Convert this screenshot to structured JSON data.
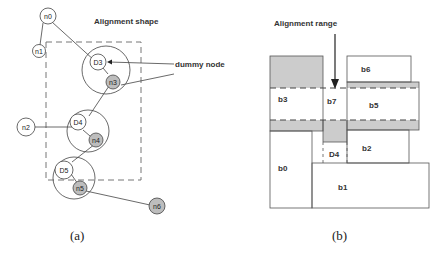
{
  "panel_a": {
    "title": "Alignment shape",
    "annotation": "dummy node",
    "caption": "(a)",
    "nodes": {
      "n0": "n0",
      "n1": "n1",
      "n2": "n2",
      "n3": "n3",
      "n4": "n4",
      "n5": "n5",
      "n6": "n6",
      "D3": "D3",
      "D4": "D4",
      "D5": "D5"
    }
  },
  "panel_b": {
    "title": "Alignment range",
    "caption": "(b)",
    "blocks": {
      "b0": "b0",
      "b1": "b1",
      "b2": "b2",
      "b3": "b3",
      "b5": "b5",
      "b6": "b6",
      "b7": "b7",
      "D4": "D4"
    }
  },
  "colors": {
    "shaded": "#cccccc",
    "line": "#444444",
    "dummy_fill": "#bdbdbd"
  }
}
